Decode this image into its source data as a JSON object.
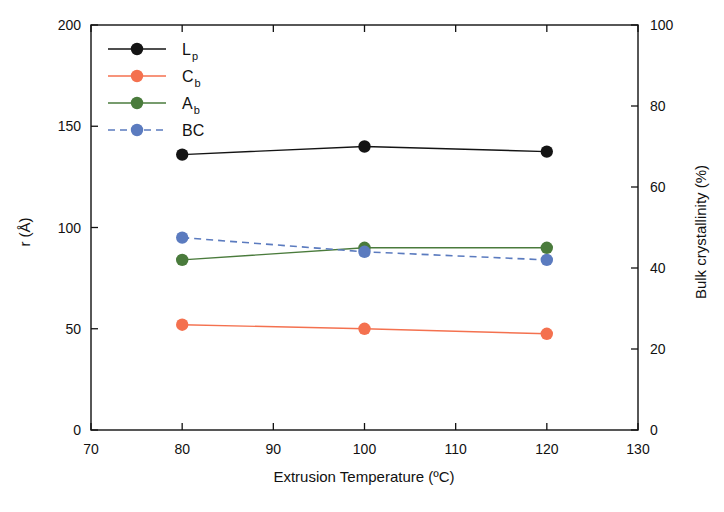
{
  "chart_data": {
    "type": "line",
    "title": "",
    "xlabel": "Extrusion Temperature (ºC)",
    "ylabel": "r (Å)",
    "y2label": "Bulk crystallinity (%)",
    "x": [
      80,
      100,
      120
    ],
    "xlim": [
      70,
      130
    ],
    "ylim": [
      0,
      200
    ],
    "y2lim": [
      0,
      100
    ],
    "xticks": [
      70,
      80,
      90,
      100,
      110,
      120,
      130
    ],
    "yticks": [
      0,
      50,
      100,
      150,
      200
    ],
    "y2ticks": [
      0,
      20,
      40,
      60,
      80,
      100
    ],
    "grid": false,
    "legend_position": "top-left inside",
    "series": [
      {
        "name": "Lp",
        "label_main": "L",
        "label_sub": "p",
        "axis": "left",
        "color": "#141414",
        "linestyle": "solid",
        "values": [
          136,
          140,
          137.5
        ]
      },
      {
        "name": "Cb",
        "label_main": "C",
        "label_sub": "b",
        "axis": "left",
        "color": "#f4714f",
        "linestyle": "solid",
        "values": [
          52,
          50,
          47.5
        ]
      },
      {
        "name": "Ab",
        "label_main": "A",
        "label_sub": "b",
        "axis": "left",
        "color": "#4a7b3c",
        "linestyle": "solid",
        "values": [
          84,
          90,
          90
        ]
      },
      {
        "name": "BC",
        "label_main": "BC",
        "label_sub": "",
        "axis": "right",
        "color": "#5b7bbf",
        "linestyle": "dashed",
        "values": [
          47.5,
          44,
          42
        ]
      }
    ]
  },
  "axes": {
    "x_tick_labels": [
      "70",
      "80",
      "90",
      "100",
      "110",
      "120",
      "130"
    ],
    "y_tick_labels": [
      "0",
      "50",
      "100",
      "150",
      "200"
    ],
    "y2_tick_labels": [
      "0",
      "20",
      "40",
      "60",
      "80",
      "100"
    ],
    "x_title": "Extrusion Temperature (ºC)",
    "y_title": "r (Å)",
    "y2_title": "Bulk crystallinity (%)"
  },
  "legend": {
    "entries": [
      {
        "main": "L",
        "sub": "p"
      },
      {
        "main": "C",
        "sub": "b"
      },
      {
        "main": "A",
        "sub": "b"
      },
      {
        "main": "BC",
        "sub": ""
      }
    ]
  },
  "colors": {
    "black": "#141414",
    "orange": "#f4714f",
    "green": "#4a7b3c",
    "blue": "#5b7bbf",
    "axis": "#111111",
    "background": "#ffffff"
  }
}
